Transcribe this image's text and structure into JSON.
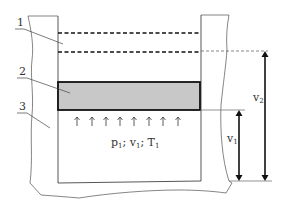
{
  "diagram": {
    "labels": [
      {
        "id": "1",
        "text": "1"
      },
      {
        "id": "2",
        "text": "2"
      },
      {
        "id": "3",
        "text": "3"
      }
    ],
    "state_label": {
      "p": "p",
      "p_sub": "1",
      "sep1": "; ",
      "v": "v",
      "v_sub": "1",
      "sep2": "; ",
      "T": "T",
      "T_sub": "1"
    },
    "dimension_v1": {
      "main": "v",
      "sub": "1"
    },
    "dimension_v2": {
      "main": "v",
      "sub": "2"
    },
    "arrow_count": 8,
    "colors": {
      "piston_fill": "#c8c8c8",
      "line": "#1a1a1a",
      "thin_line": "#555555"
    }
  }
}
